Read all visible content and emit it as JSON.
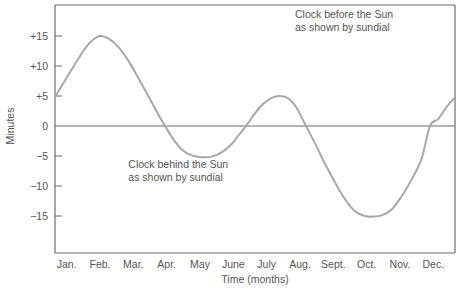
{
  "chart_data": {
    "type": "line",
    "title": "",
    "xlabel": "Time (months)",
    "ylabel": "Minutes",
    "categories": [
      "Jan.",
      "Feb.",
      "Mar.",
      "Apr.",
      "May",
      "June",
      "July",
      "Aug.",
      "Sept.",
      "Oct.",
      "Nov.",
      "Dec."
    ],
    "xlim": [
      0,
      12
    ],
    "ylim": [
      -20,
      19
    ],
    "yticks": [
      15,
      10,
      5,
      0,
      -5,
      -10,
      -15
    ],
    "ytick_labels": [
      "+15",
      "+10",
      "+5",
      "0",
      "−5",
      "−10",
      "−15"
    ],
    "grid": false,
    "zero_line": true,
    "series": [
      {
        "name": "Equation of time",
        "color": "#a8a8a8",
        "points": [
          [
            0.0,
            4.8
          ],
          [
            0.3,
            7.6
          ],
          [
            0.6,
            10.3
          ],
          [
            0.9,
            12.9
          ],
          [
            1.15,
            14.4
          ],
          [
            1.35,
            15.0
          ],
          [
            1.6,
            14.6
          ],
          [
            1.9,
            13.2
          ],
          [
            2.2,
            10.9
          ],
          [
            2.5,
            8.0
          ],
          [
            2.8,
            5.0
          ],
          [
            3.05,
            2.4
          ],
          [
            3.3,
            0.0
          ],
          [
            3.55,
            -2.2
          ],
          [
            3.8,
            -3.9
          ],
          [
            4.1,
            -4.9
          ],
          [
            4.4,
            -5.2
          ],
          [
            4.7,
            -5.1
          ],
          [
            5.0,
            -4.4
          ],
          [
            5.3,
            -3.0
          ],
          [
            5.5,
            -1.6
          ],
          [
            5.73,
            0.0
          ],
          [
            6.0,
            2.1
          ],
          [
            6.25,
            3.7
          ],
          [
            6.5,
            4.7
          ],
          [
            6.75,
            5.0
          ],
          [
            7.0,
            4.6
          ],
          [
            7.25,
            3.0
          ],
          [
            7.53,
            0.0
          ],
          [
            7.8,
            -2.9
          ],
          [
            8.1,
            -6.3
          ],
          [
            8.4,
            -9.4
          ],
          [
            8.7,
            -12.2
          ],
          [
            9.0,
            -14.2
          ],
          [
            9.3,
            -15.0
          ],
          [
            9.55,
            -15.1
          ],
          [
            9.8,
            -14.9
          ],
          [
            10.1,
            -13.9
          ],
          [
            10.4,
            -11.7
          ],
          [
            10.7,
            -8.9
          ],
          [
            11.0,
            -5.4
          ],
          [
            11.25,
            0.0
          ],
          [
            11.5,
            1.2
          ],
          [
            11.75,
            3.2
          ],
          [
            12.0,
            4.8
          ]
        ]
      }
    ],
    "annotations": [
      {
        "lines": [
          "Clock before the Sun",
          "as shown by sundial"
        ],
        "x": 7.2,
        "y": 18
      },
      {
        "lines": [
          "Clock behind the Sun",
          "as shown by sundial"
        ],
        "x": 2.2,
        "y": -7
      }
    ]
  }
}
